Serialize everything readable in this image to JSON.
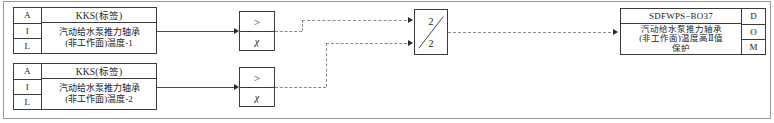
{
  "diagram": {
    "line_color": "#8a8a8a",
    "border_color": "#3a3a3a"
  },
  "input_blocks": [
    {
      "row_labels": [
        "A",
        "I",
        "L"
      ],
      "kks_label": "KKS(标签)",
      "description_lines": [
        "汽动给水泵推力轴承",
        "(非工作面)温度-1"
      ]
    },
    {
      "row_labels": [
        "A",
        "I",
        "L"
      ],
      "kks_label": "KKS(标签)",
      "description_lines": [
        "汽动给水泵推力轴承",
        "(非工作面)温度-2"
      ]
    }
  ],
  "comparators": [
    {
      "operator": ">",
      "setpoint_symbol": "χ"
    },
    {
      "operator": ">",
      "setpoint_symbol": "χ"
    }
  ],
  "voter": {
    "top_value": "2",
    "bottom_value": "2"
  },
  "output_block": {
    "tag": "SDFWPS−BO37",
    "description_lines": [
      "汽动给水泵推力轴承",
      "(非工作面)温度高Ⅱ值",
      "保护"
    ],
    "row_labels": [
      "D",
      "O",
      "M"
    ]
  }
}
